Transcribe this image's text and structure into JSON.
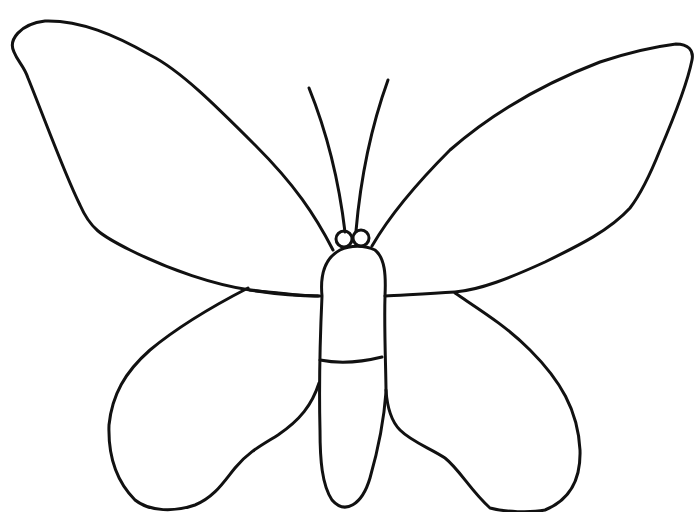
{
  "image": {
    "subject": "Butterfly outline coloring page",
    "background_color": "#ffffff",
    "line_color": "#111111"
  },
  "parts": {
    "left_forewing": "left-forewing",
    "right_forewing": "right-forewing",
    "left_hindwing": "left-hindwing",
    "right_hindwing": "right-hindwing",
    "body": "body",
    "antennae": "antennae",
    "eyes": "eyes"
  }
}
